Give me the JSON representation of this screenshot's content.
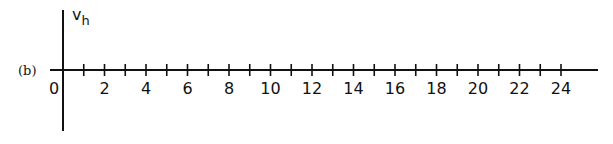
{
  "chart_data": {
    "type": "line",
    "title": "",
    "panel_label": "(b)",
    "ylabel": "v",
    "ylabel_subscript": "h",
    "xlabel": "",
    "xlim": [
      0,
      25.7
    ],
    "x_ticks_minor_step": 1,
    "x_tick_labels": [
      "0",
      "2",
      "4",
      "6",
      "8",
      "10",
      "12",
      "14",
      "16",
      "18",
      "20",
      "22",
      "24"
    ],
    "x_tick_label_values": [
      0,
      2,
      4,
      6,
      8,
      10,
      12,
      14,
      16,
      18,
      20,
      22,
      24
    ],
    "series": [],
    "grid": false,
    "legend": "none"
  }
}
